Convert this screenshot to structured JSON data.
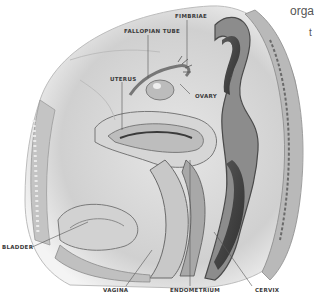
{
  "figure": {
    "type": "anatomical illustration",
    "style": "grayscale pencil sagittal cross-section",
    "colors": {
      "background": "#ffffff",
      "label_text": "#3a3a3a",
      "leader_line": "#555555",
      "tissue_light": "#d8d8d8",
      "tissue_mid": "#a8a8a8",
      "tissue_dark": "#4a4a4a"
    }
  },
  "labels": {
    "fimbriae": "FIMBRIAE",
    "fallopian_tube": "FALLOPIAN TUBE",
    "uterus": "UTERUS",
    "ovary": "OVARY",
    "bladder": "BLADDER",
    "vagina": "VAGINA",
    "endometrium": "ENDOMETRIUM",
    "cervix": "CERVIX"
  },
  "text_fragments": {
    "top_right": "organ",
    "right_edge": "t"
  }
}
